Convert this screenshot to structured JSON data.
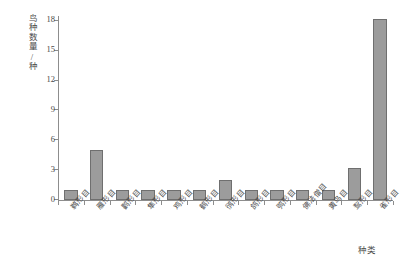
{
  "chart_data": {
    "type": "bar",
    "title": "",
    "subtitle": "",
    "xlabel": "种类",
    "ylabel": "鸟种数量/种",
    "categories": [
      "鹈形目",
      "雁形目",
      "鹳形目",
      "隼形目",
      "鸡形目",
      "鹤形目",
      "鸻形目",
      "鸽形目",
      "鸮形目",
      "佛法僧目",
      "黄鸟目",
      "䴕形目",
      "雀形目"
    ],
    "values": [
      1,
      5,
      1,
      1,
      1,
      1,
      2,
      1,
      1,
      1,
      1,
      3.2,
      18.2
    ],
    "ylim": [
      0,
      18.6
    ],
    "yticks": [
      0,
      3,
      6,
      9,
      12,
      15,
      18
    ],
    "ytick_labels": [
      "0",
      "3",
      "6",
      "9",
      "12",
      "15",
      "18"
    ],
    "grid": false,
    "legend": false,
    "legend_position": "none",
    "bar_fill_color": "#9c9c9c",
    "bar_edge_color": "#6f6f6f",
    "axis_color": "#8d8d8d",
    "text_color": "#4a4a4a",
    "background_color": "#ffffff"
  }
}
